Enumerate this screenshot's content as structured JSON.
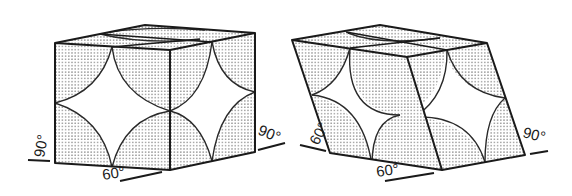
{
  "diagram": {
    "colors": {
      "line": "#1a1a1a",
      "dot_fill": "#9a9a9a",
      "background": "#ffffff"
    },
    "left_cell": {
      "angle_labels": {
        "left": "90°",
        "bottom": "60°",
        "right": "90°"
      }
    },
    "right_cell": {
      "angle_labels": {
        "left": "60°",
        "bottom": "60°",
        "right": "90°"
      }
    }
  }
}
